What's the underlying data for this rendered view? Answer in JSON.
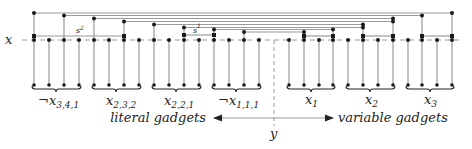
{
  "axis": {
    "x_label": "x",
    "y_label": "y"
  },
  "pair_labels": {
    "left_pair": "s",
    "left_pair_sup": "2",
    "mid_pair": "s",
    "mid_pair_sup": "1"
  },
  "literal_gadgets": [
    {
      "label": "¬x",
      "sub": "3,4,1"
    },
    {
      "label": "x",
      "sub": "2,3,2"
    },
    {
      "label": "x",
      "sub": "2,2,1"
    },
    {
      "label": "¬x",
      "sub": "1,1,1"
    }
  ],
  "variable_gadgets": [
    {
      "label": "x",
      "sub": "1"
    },
    {
      "label": "x",
      "sub": "2"
    },
    {
      "label": "x",
      "sub": "3"
    }
  ],
  "legend": {
    "left_text": "literal gadgets",
    "right_text": "variable gadgets"
  },
  "colors": {
    "line": "#9a9a9a",
    "dot": "#1a1a1a",
    "text": "#222222"
  }
}
